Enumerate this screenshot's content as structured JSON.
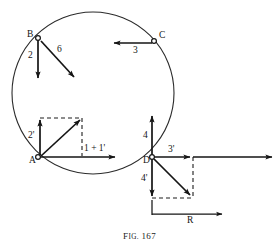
{
  "figure": {
    "caption_prefix": "F",
    "caption_smallcaps": "IG.",
    "caption_number": "167",
    "caption_full": "Fig. 167",
    "ink_color": "#151515",
    "paper_color": "#ffffff"
  },
  "points": {
    "a": {
      "label": "A",
      "x": 38,
      "y": 157
    },
    "b": {
      "label": "B",
      "x": 38,
      "y": 38
    },
    "c": {
      "label": "C",
      "x": 155,
      "y": 41
    },
    "d": {
      "label": "D",
      "x": 152,
      "y": 157
    }
  },
  "circle": {
    "center_x": 93,
    "center_y": 93,
    "radius": 81
  },
  "vectors": {
    "b_down": {
      "label": "2",
      "from": "B",
      "direction": "down",
      "magnitude": 2
    },
    "b_diagonal": {
      "label": "6",
      "from": "B",
      "direction": "down-right",
      "magnitude": 6
    },
    "c_left": {
      "label": "3",
      "from": "C",
      "direction": "left",
      "magnitude": 3
    },
    "a_up": {
      "label": "2'",
      "from": "A",
      "direction": "up",
      "magnitude": 2
    },
    "a_right": {
      "label": "1 + 1'",
      "from": "A",
      "direction": "right",
      "magnitude": 2
    },
    "d_up": {
      "label": "4",
      "from": "D",
      "direction": "up",
      "magnitude": 4
    },
    "d_right": {
      "label": "3'",
      "from": "D",
      "direction": "right",
      "magnitude": 3
    },
    "d_down": {
      "label": "4'",
      "from": "D",
      "direction": "down",
      "magnitude": 4
    },
    "resultant": {
      "label": "R",
      "from": "D",
      "direction": "right"
    }
  },
  "labels": {
    "point_a": "A",
    "point_b": "B",
    "point_c": "C",
    "point_d": "D",
    "two": "2",
    "six": "6",
    "three": "3",
    "two_prime": "2'",
    "one_plus_one_prime": "1 + 1'",
    "four": "4",
    "three_prime": "3'",
    "four_prime": "4'",
    "resultant_r": "R"
  }
}
